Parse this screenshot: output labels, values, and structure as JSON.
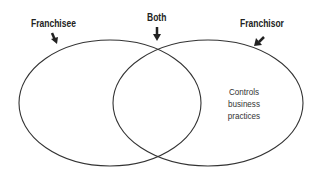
{
  "diagram": {
    "type": "venn",
    "sets": [
      {
        "label": "Franchisee",
        "contents": []
      },
      {
        "label": "Franchisor",
        "contents": [
          "Controls",
          "business",
          "practices"
        ]
      }
    ],
    "intersection_label": "Both",
    "colors": {
      "stroke": "#333333",
      "text": "#222222",
      "background": "#ffffff"
    }
  }
}
